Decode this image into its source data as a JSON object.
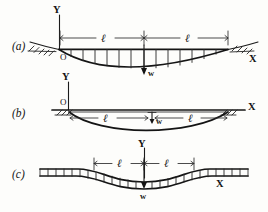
{
  "figure": {
    "panels": [
      {
        "id": "a",
        "label": "(a)",
        "origin_label": "O",
        "y_axis_label": "Y",
        "x_axis_label": "X",
        "span_left_label": "ℓ",
        "span_right_label": "ℓ",
        "load_label": "w",
        "load_direction": "down",
        "support_left": "hatched-ground",
        "support_right": "hatched-ground",
        "curve": "sagging",
        "description": "Origin O at left support, Y axis upward at left end, X axis to the right at right support, uniformly distributed load w over two spans of length l, beam sags downward"
      },
      {
        "id": "b",
        "label": "(b)",
        "origin_label": "O",
        "y_axis_label": "Y",
        "x_axis_label": "X",
        "span_left_label": "ℓ",
        "span_right_label": "ℓ",
        "load_label": "w",
        "load_direction": "down",
        "support_left": "hatched-ground",
        "support_right": "hatched-ground",
        "curve": "sagging",
        "description": "Origin O above left support, X axis horizontal along top through both supports, beam curve sags beneath the axis, single downward load arrow w at mid-span"
      },
      {
        "id": "c",
        "label": "(c)",
        "origin_label": "",
        "y_axis_label": "Y",
        "x_axis_label": "X",
        "span_left_label": "ℓ",
        "span_right_label": "ℓ",
        "load_label": "w",
        "load_direction": "down",
        "support_left": "none",
        "support_right": "none",
        "curve": "s-shaped",
        "description": "Continuous beam with S-shaped deflection, Y axis at centre, distributed hatch load along full length, downward load arrow w at the centre, X axis to the right"
      }
    ],
    "symbols": {
      "length": "ℓ",
      "load": "w",
      "origin": "O",
      "x_axis": "X",
      "y_axis": "Y"
    },
    "colors": {
      "ink": "#141414",
      "paper": "#fdfdfb"
    }
  }
}
